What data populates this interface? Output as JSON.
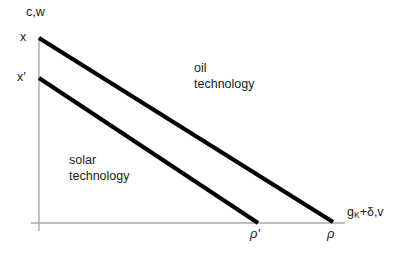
{
  "figure": {
    "width": 405,
    "height": 254,
    "background": "#ffffff",
    "axis_color": "#a8a8a8",
    "curve_color": "#000000",
    "text_color": "#1b1b1b"
  },
  "axes": {
    "y_title": "c,w",
    "x_title_main": "g",
    "x_title_sub": "K",
    "x_title_rest": "+δ,v",
    "y_intercepts": {
      "upper": "x",
      "lower": "x′"
    },
    "x_intercepts": {
      "lower": "ρ′",
      "upper": "ρ"
    }
  },
  "regions": {
    "oil": {
      "line1": "oil",
      "line2": "technology"
    },
    "solar": {
      "line1": "solar",
      "line2": "technology"
    }
  },
  "chart_data": {
    "type": "line",
    "title": "",
    "xlabel": "g_K + δ, v",
    "ylabel": "c,w",
    "xlim": [
      0,
      345
    ],
    "ylim": [
      0,
      200
    ],
    "grid": false,
    "legend": "none",
    "axis_origin": {
      "x": 39,
      "y": 223
    },
    "series": [
      {
        "name": "oil technology frontier",
        "points": [
          [
            0,
            185
          ],
          [
            294,
            0
          ]
        ],
        "pixel_points": [
          [
            39,
            38
          ],
          [
            333,
            222
          ]
        ],
        "y_intercept_label": "x",
        "x_intercept_label": "ρ",
        "linewidth": 4.2,
        "color": "#000000"
      },
      {
        "name": "solar technology frontier",
        "points": [
          [
            0,
            145
          ],
          [
            219,
            0
          ]
        ],
        "pixel_points": [
          [
            39,
            78
          ],
          [
            258,
            223
          ]
        ],
        "y_intercept_label": "x′",
        "x_intercept_label": "ρ′",
        "linewidth": 4.2,
        "color": "#000000"
      }
    ],
    "annotations": [
      {
        "text": "oil technology",
        "pixel_x": 194,
        "pixel_y": 61
      },
      {
        "text": "solar technology",
        "pixel_x": 69,
        "pixel_y": 153
      }
    ]
  }
}
